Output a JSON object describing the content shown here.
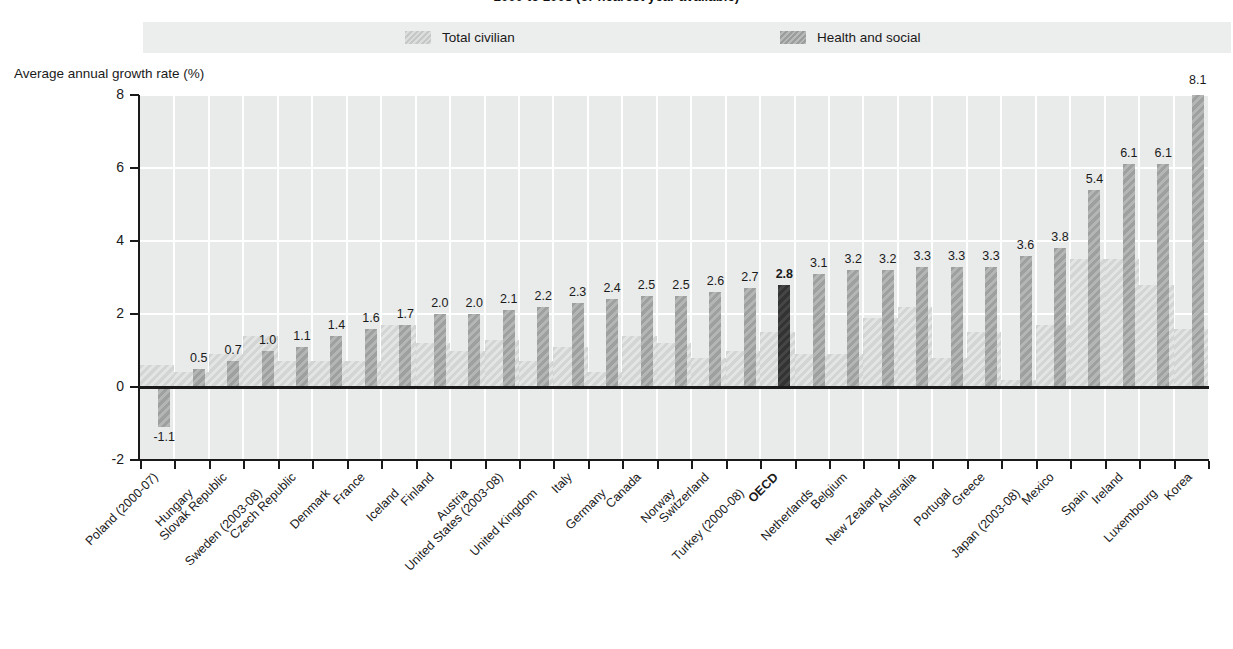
{
  "title": "2000 to 2008 (or nearest year available)",
  "y_axis_title": "Average annual growth rate (%)",
  "legend": {
    "total_label": "Total civilian",
    "health_label": "Health and social"
  },
  "colors": {
    "plot_background": "#e9eaea",
    "legend_background": "#eceded",
    "gridline": "#ffffff",
    "total_civilian": "#dcdede",
    "health_and_social": "#a9abab",
    "highlight": "#3a3a3a",
    "axis": "#1a1a1a"
  },
  "chart_data": {
    "type": "bar",
    "title": "2000 to 2008 (or nearest year available)",
    "xlabel": "",
    "ylabel": "Average annual growth rate (%)",
    "ylim": [
      -2,
      8
    ],
    "yticks": [
      -2,
      0,
      2,
      4,
      6,
      8
    ],
    "grid": true,
    "legend_position": "top",
    "highlight_category": "OECD",
    "categories": [
      "Poland (2000-07)",
      "Hungary",
      "Slovak Republic",
      "Sweden (2003-08)",
      "Czech Republic",
      "Denmark",
      "France",
      "Iceland",
      "Finland",
      "Austria",
      "United States (2003-08)",
      "United Kingdom",
      "Italy",
      "Germany",
      "Canada",
      "Norway",
      "Switzerland",
      "Turkey (2000-08)",
      "OECD",
      "Netherlands",
      "Belgium",
      "New Zealand",
      "Australia",
      "Portugal",
      "Greece",
      "Japan (2003-08)",
      "Mexico",
      "Spain",
      "Ireland",
      "Luxembourg",
      "Korea"
    ],
    "series": [
      {
        "name": "Health and social",
        "values": [
          -1.1,
          0.5,
          0.7,
          1.0,
          1.1,
          1.4,
          1.6,
          1.7,
          2.0,
          2.0,
          2.1,
          2.2,
          2.3,
          2.4,
          2.5,
          2.5,
          2.6,
          2.7,
          2.8,
          3.1,
          3.2,
          3.2,
          3.3,
          3.3,
          3.3,
          3.6,
          3.8,
          5.4,
          6.1,
          6.1,
          8.1
        ],
        "labels": [
          "-1.1",
          "0.5",
          "0.7",
          "1.0",
          "1.1",
          "1.4",
          "1.6",
          "1.7",
          "2.0",
          "2.0",
          "2.1",
          "2.2",
          "2.3",
          "2.4",
          "2.5",
          "2.5",
          "2.6",
          "2.7",
          "2.8",
          "3.1",
          "3.2",
          "3.2",
          "3.3",
          "3.3",
          "3.3",
          "3.6",
          "3.8",
          "5.4",
          "6.1",
          "6.1",
          "8.1"
        ]
      },
      {
        "name": "Total civilian",
        "values": [
          0.6,
          0.4,
          0.9,
          1.4,
          0.7,
          0.7,
          0.7,
          1.7,
          1.2,
          1.0,
          1.3,
          0.7,
          1.1,
          0.4,
          1.4,
          1.2,
          0.8,
          1.0,
          1.5,
          0.9,
          0.9,
          1.9,
          2.2,
          0.8,
          1.5,
          0.2,
          1.7,
          3.5,
          3.5,
          2.8,
          1.6
        ]
      }
    ]
  }
}
